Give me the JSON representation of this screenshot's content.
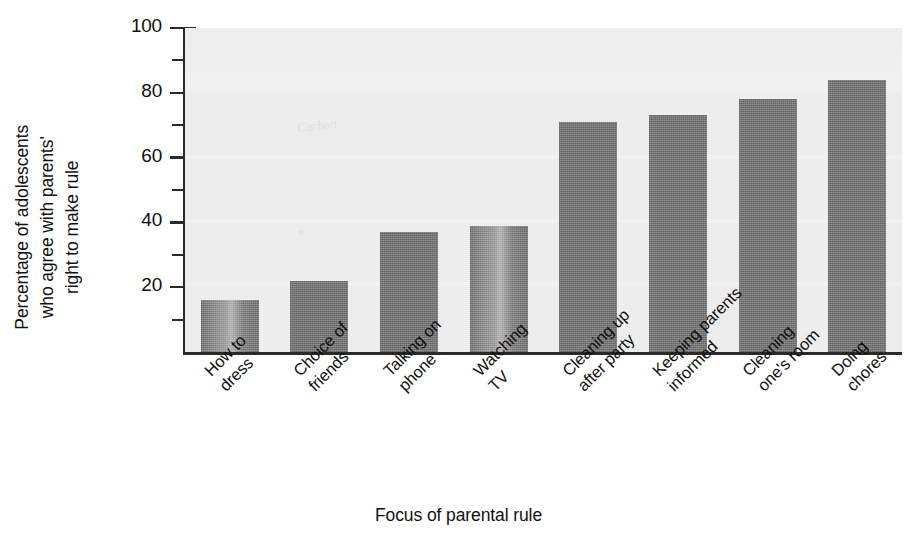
{
  "chart_data": {
    "type": "bar",
    "title": "",
    "xlabel": "Focus of parental rule",
    "ylabel": "Percentage of adolescents\nwho agree with parents'\nright to make rule",
    "categories": [
      "How to\ndress",
      "Choice of\nfriends",
      "Talking on\nphone",
      "Watching\nTV",
      "Cleaning up\nafter party",
      "Keeping parents\ninformed",
      "Cleaning\none's room",
      "Doing\nchores"
    ],
    "values": [
      16,
      22,
      37,
      39,
      71,
      73,
      78,
      84
    ],
    "ylim": [
      0,
      100
    ],
    "y_major_ticks": [
      0,
      20,
      40,
      60,
      80,
      100
    ],
    "y_major_tick_labels": [
      "",
      "20",
      "40",
      "60",
      "80",
      "100"
    ],
    "y_minor_ticks": [
      10,
      30,
      50,
      70,
      90
    ],
    "grid": "horizontal-faint",
    "legend": "none",
    "bar_color": "#787878",
    "plot_background": "#efefef",
    "axis_color": "#2a2a2a"
  }
}
